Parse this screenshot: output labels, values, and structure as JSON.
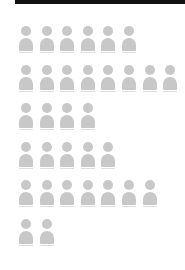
{
  "chart_data": {
    "type": "pictogram",
    "title": "",
    "xlabel": "",
    "ylabel": "",
    "icon": "person-icon",
    "categories": [
      "Row 1",
      "Row 2",
      "Row 3",
      "Row 4",
      "Row 5",
      "Row 6"
    ],
    "values": [
      6,
      8,
      4,
      5,
      7,
      2
    ],
    "grid": false,
    "legend": null
  },
  "colors": {
    "icon": "#c8c8c8",
    "top_bar": "#111111",
    "background": "#ffffff"
  }
}
